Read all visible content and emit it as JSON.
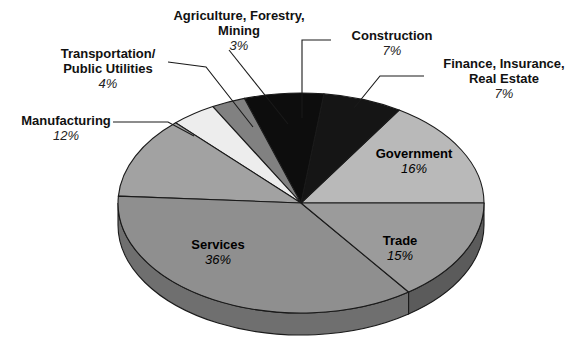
{
  "chart_data": {
    "type": "pie",
    "title": "",
    "subtitle": "",
    "xlabel": "",
    "ylabel": "",
    "legend_position": "callout-labels",
    "grid": false,
    "three_d": true,
    "categories": [
      "Construction",
      "Finance, Insurance, Real Estate",
      "Government",
      "Trade",
      "Services",
      "Manufacturing",
      "Transportation/ Public Utilities",
      "Agriculture, Forestry, Mining"
    ],
    "values": [
      7,
      7,
      16,
      15,
      36,
      12,
      4,
      3
    ],
    "unit": "percent",
    "slices": [
      {
        "name": "construction",
        "label": "Construction",
        "percent_text": "7%",
        "value": 7,
        "color": "#0d0d0d",
        "side_color": "#000000",
        "label_kind": "callout"
      },
      {
        "name": "finance-insurance-real-estate",
        "label_line1": "Finance, Insurance,",
        "label_line2": "Real Estate",
        "percent_text": "7%",
        "value": 7,
        "color": "#151515",
        "side_color": "#000000",
        "label_kind": "callout"
      },
      {
        "name": "government",
        "label": "Government",
        "percent_text": "16%",
        "value": 16,
        "color": "#b9b9b9",
        "side_color": "#8d8d8d",
        "label_kind": "inside"
      },
      {
        "name": "trade",
        "label": "Trade",
        "percent_text": "15%",
        "value": 15,
        "color": "#9b9b9b",
        "side_color": "#5b5b5b",
        "label_kind": "inside"
      },
      {
        "name": "services",
        "label": "Services",
        "percent_text": "36%",
        "value": 36,
        "color": "#8f8f8f",
        "side_color": "#6f6f6f",
        "label_kind": "inside"
      },
      {
        "name": "manufacturing",
        "label": "Manufacturing",
        "percent_text": "12%",
        "value": 12,
        "color": "#a2a2a2",
        "side_color": "#7c7c7c",
        "label_kind": "callout"
      },
      {
        "name": "transportation-public-utilities",
        "label_line1": "Transportation/",
        "label_line2": "Public Utilities",
        "percent_text": "4%",
        "value": 4,
        "color": "#ededed",
        "side_color": "#c4c4c4",
        "label_kind": "callout"
      },
      {
        "name": "agriculture-forestry-mining",
        "label_line1": "Agriculture, Forestry,",
        "label_line2": "Mining",
        "percent_text": "3%",
        "value": 3,
        "color": "#818181",
        "side_color": "#626262",
        "label_kind": "callout"
      }
    ]
  },
  "labels": {
    "agriculture": {
      "line1": "Agriculture, Forestry,",
      "line2": "Mining",
      "percent": "3%"
    },
    "transportation": {
      "line1": "Transportation/",
      "line2": "Public Utilities",
      "percent": "4%"
    },
    "manufacturing": {
      "line1": "Manufacturing",
      "percent": "12%"
    },
    "construction": {
      "line1": "Construction",
      "percent": "7%"
    },
    "finance": {
      "line1": "Finance, Insurance,",
      "line2": "Real Estate",
      "percent": "7%"
    },
    "government": {
      "line1": "Government",
      "percent": "16%"
    },
    "trade": {
      "line1": "Trade",
      "percent": "15%"
    },
    "services": {
      "line1": "Services",
      "percent": "36%"
    }
  },
  "colors": {
    "background": "#ffffff",
    "outline": "#1a1a1a",
    "leader_line": "#1a1a1a",
    "text": "#000000"
  }
}
